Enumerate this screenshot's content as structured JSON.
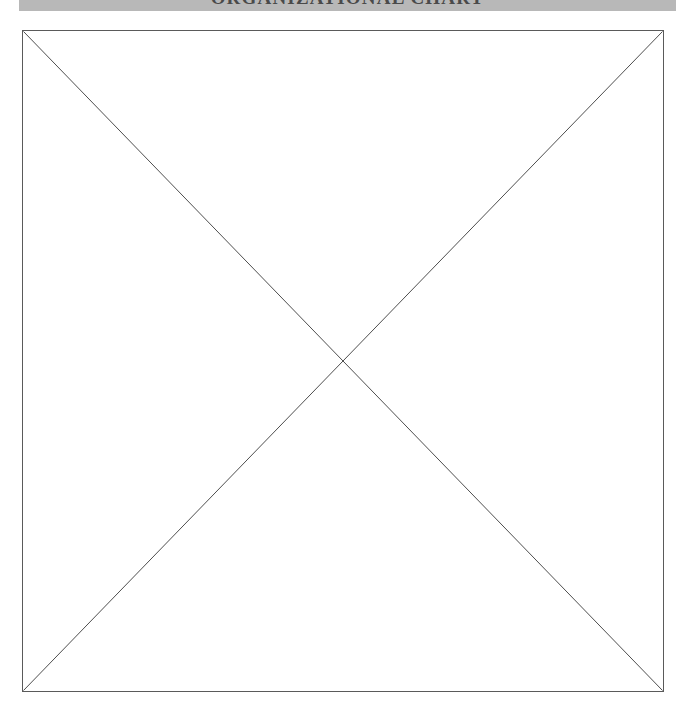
{
  "page": {
    "background_color": "#ffffff",
    "width": 688,
    "height": 718
  },
  "header": {
    "title": "ORGANIZATIONAL CHART",
    "banner_color": "#b8b8b8",
    "text_color": "#4a4a4a",
    "clipped": "true"
  },
  "content": {
    "placeholder": {
      "label": "missing-image-placeholder",
      "border_color": "#5a5a5a",
      "fill_color": "#ffffff",
      "cross_color": "#4d4d4d",
      "alt_text": ""
    }
  }
}
